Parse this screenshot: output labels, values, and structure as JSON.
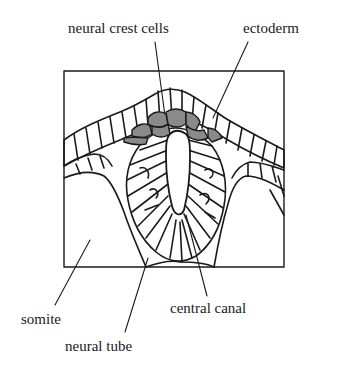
{
  "figure": {
    "type": "biological cross-section diagram",
    "colors": {
      "line": "#1a1a1a",
      "background": "#ffffff",
      "neural_crest_fill": "#8a8a8a"
    }
  },
  "labels": {
    "neural_crest_cells": "neural crest cells",
    "ectoderm": "ectoderm",
    "somite": "somite",
    "central_canal": "central canal",
    "neural_tube": "neural tube"
  }
}
